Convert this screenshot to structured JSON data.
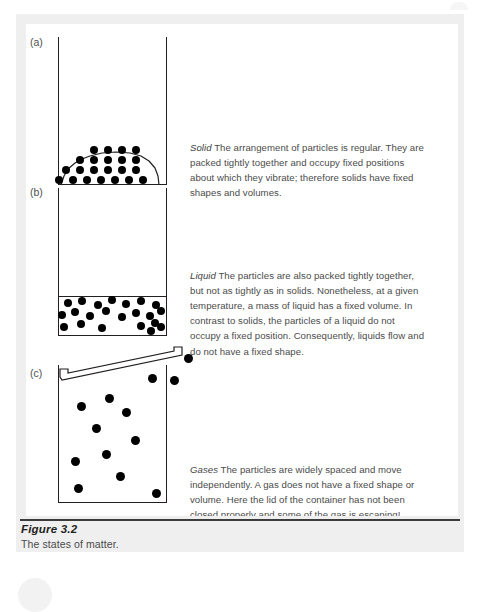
{
  "figure": {
    "caption_title": "Figure 3.2",
    "caption_subtitle": "The states of matter.",
    "panels": [
      {
        "label": "(a)",
        "state_term": "Solid",
        "description": " The arrangement of particles is regular. They are packed tightly together and occupy fixed positions about which they vibrate; therefore solids have fixed shapes and volumes."
      },
      {
        "label": "(b)",
        "state_term": "Liquid",
        "description": " The particles are also packed tightly together, but not as tightly as in solids. Nonetheless, at a given temperature, a mass of liquid has a fixed volume. In contrast to solids, the particles of a liquid do not occupy a fixed position. Consequently, liquids flow and do not have a fixed shape."
      },
      {
        "label": "(c)",
        "state_term": "Gases",
        "description": " The particles are widely spaced and move independently. A gas does not have a fixed shape or volume. Here the lid of the container has not been closed properly and some of the gas is escaping!"
      }
    ]
  },
  "colors": {
    "ink": "#231f20",
    "particle": "#000000",
    "body_text": "#4b4b4b",
    "panel_background": "#ffffff",
    "frame_background": "#efefef"
  },
  "diagram": {
    "solid": {
      "particle_radius": 4.1,
      "rows": [
        {
          "y": 148,
          "xs": [
            90,
            104,
            118,
            132
          ]
        },
        {
          "y": 157,
          "xs": [
            83,
            97,
            111,
            125,
            139
          ]
        },
        {
          "y": 166,
          "xs": [
            78,
            92,
            106,
            120,
            134,
            148
          ]
        },
        {
          "y": 175,
          "xs": [
            68,
            82,
            96,
            110,
            124,
            138,
            152
          ]
        }
      ]
    },
    "liquid": {
      "particle_radius": 4.1,
      "surface_y": 297,
      "points": [
        [
          72,
          303
        ],
        [
          86,
          301
        ],
        [
          100,
          304
        ],
        [
          113,
          300
        ],
        [
          127,
          302
        ],
        [
          140,
          299
        ],
        [
          152,
          303
        ],
        [
          163,
          301
        ],
        [
          66,
          314
        ],
        [
          80,
          312
        ],
        [
          94,
          316
        ],
        [
          108,
          311
        ],
        [
          122,
          314
        ],
        [
          135,
          312
        ],
        [
          148,
          316
        ],
        [
          160,
          313
        ],
        [
          64,
          326
        ],
        [
          78,
          324
        ],
        [
          92,
          328
        ],
        [
          106,
          323
        ],
        [
          119,
          327
        ],
        [
          133,
          324
        ],
        [
          146,
          328
        ],
        [
          158,
          326
        ]
      ]
    },
    "gas": {
      "particle_radius": 4.4,
      "inside": [
        [
          82,
          404
        ],
        [
          110,
          396
        ],
        [
          125,
          410
        ],
        [
          96,
          427
        ],
        [
          122,
          438
        ],
        [
          136,
          420
        ],
        [
          76,
          453
        ],
        [
          94,
          470
        ],
        [
          112,
          459
        ],
        [
          157,
          492
        ],
        [
          153,
          376
        ]
      ],
      "escaping": [
        [
          188,
          355
        ],
        [
          175,
          378
        ]
      ]
    }
  }
}
